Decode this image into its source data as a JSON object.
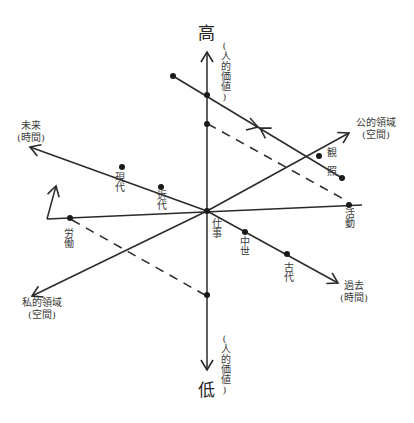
{
  "diagram": {
    "type": "multi-axis conceptual diagram",
    "vertical_axis": {
      "top_label": "高",
      "bottom_label": "低",
      "top_side_label": "(人的価値)",
      "bottom_side_label": "(人的価値)"
    },
    "time_axis": {
      "future_label": "未来",
      "future_sub": "(時間)",
      "past_label": "過去",
      "past_sub": "(時間)",
      "points": [
        "現代",
        "近代",
        "中世",
        "古代"
      ]
    },
    "space_axis": {
      "public_label": "公的領域",
      "public_sub": "(空間)",
      "private_label": "私的領域",
      "private_sub": "(空間)"
    },
    "activity_axis": {
      "labor_label": "労働",
      "work_label": "仕事",
      "action_label": "活動"
    },
    "contemplation": {
      "label_1": "観",
      "label_2": "照"
    },
    "colors": {
      "line": "#2a2a2a",
      "text": "#3a3a3a",
      "background": "#ffffff"
    }
  }
}
